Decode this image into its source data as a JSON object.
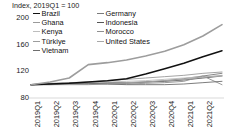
{
  "chart_data": {
    "type": "line",
    "title": "Index, 2019Q1 = 100",
    "xlabel": "",
    "ylabel": "",
    "ylim": [
      80,
      215
    ],
    "yticks": [
      80,
      120,
      160,
      200
    ],
    "grid": false,
    "legend_position": "top-left",
    "categories": [
      "2019Q1",
      "2019Q2",
      "2019Q3",
      "2019Q4",
      "2020Q1",
      "2020Q2",
      "2020Q3",
      "2020Q4",
      "2021Q1",
      "2021Q2",
      "2021Q3"
    ],
    "series": [
      {
        "name": "Brazil",
        "color": "#111111",
        "width": 1.5,
        "values": [
          100,
          101,
          102,
          104,
          106,
          109,
          116,
          124,
          132,
          142,
          151
        ]
      },
      {
        "name": "Germany",
        "color": "#7a7a7a",
        "width": 0.9,
        "values": [
          100,
          100,
          101,
          101,
          102,
          102,
          104,
          106,
          109,
          113,
          117
        ]
      },
      {
        "name": "Ghana",
        "color": "#9a9a9a",
        "width": 0.9,
        "values": [
          100,
          102,
          103,
          104,
          106,
          108,
          110,
          112,
          114,
          117,
          119
        ]
      },
      {
        "name": "Indonesia",
        "color": "#555555",
        "width": 0.9,
        "values": [
          100,
          101,
          102,
          102,
          103,
          103,
          104,
          105,
          107,
          110,
          113
        ]
      },
      {
        "name": "Kenya",
        "color": "#bdbdbd",
        "width": 0.9,
        "values": [
          100,
          101,
          102,
          103,
          104,
          105,
          106,
          108,
          110,
          112,
          113
        ]
      },
      {
        "name": "Morocco",
        "color": "#8f8f8f",
        "width": 0.9,
        "values": [
          100,
          100,
          100,
          100,
          101,
          101,
          102,
          103,
          105,
          113,
          100
        ]
      },
      {
        "name": "Türkiye",
        "color": "#9d9d9d",
        "width": 1.6,
        "values": [
          100,
          104,
          110,
          130,
          133,
          137,
          143,
          150,
          160,
          173,
          190
        ]
      },
      {
        "name": "United States",
        "color": "#a8a8a8",
        "width": 0.9,
        "values": [
          100,
          101,
          101,
          102,
          102,
          103,
          104,
          106,
          108,
          111,
          114
        ]
      },
      {
        "name": "Vietnam",
        "color": "#6e6e6e",
        "width": 0.9,
        "values": [
          100,
          101,
          102,
          102,
          101,
          100,
          100,
          100,
          101,
          103,
          105
        ]
      }
    ]
  },
  "legend": {
    "column1": [
      {
        "label": "Brazil"
      },
      {
        "label": "Ghana"
      },
      {
        "label": "Kenya"
      },
      {
        "label": "Türkiye"
      },
      {
        "label": "Vietnam"
      }
    ],
    "column2": [
      {
        "label": "Germany"
      },
      {
        "label": "Indonesia"
      },
      {
        "label": "Morocco"
      },
      {
        "label": "United States"
      }
    ]
  }
}
